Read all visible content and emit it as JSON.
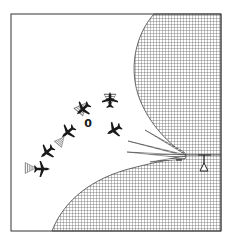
{
  "diagram": {
    "type": "illustration",
    "colors": {
      "background": "#ffffff",
      "ink": "#1a1a1a",
      "hatch": "#555555",
      "frame": "#333333"
    },
    "frame": {
      "x": 11,
      "y": 14,
      "w": 210,
      "h": 217
    },
    "radar": {
      "label": "",
      "icon": "radar-antenna-icon",
      "x": 204,
      "y": 155
    },
    "beams": [
      {
        "tip": [
          145,
          130
        ]
      },
      {
        "tip": [
          128,
          141
        ]
      },
      {
        "tip": [
          127,
          152
        ]
      },
      {
        "tip": [
          150,
          162
        ]
      }
    ],
    "beam_origin": [
      186,
      155
    ],
    "aircraft": [
      {
        "x": 82,
        "y": 108,
        "rot": 40
      },
      {
        "x": 110,
        "y": 102,
        "rot": 0
      },
      {
        "x": 115,
        "y": 131,
        "rot": 60
      },
      {
        "x": 68,
        "y": 133,
        "rot": 40
      },
      {
        "x": 47,
        "y": 153,
        "rot": 40
      },
      {
        "x": 41,
        "y": 168,
        "rot": 90
      }
    ],
    "jammer_cones": [
      {
        "x": 91,
        "y": 95,
        "rot": 220
      },
      {
        "x": 110,
        "y": 114,
        "rot": 180
      },
      {
        "x": 60,
        "y": 144,
        "rot": 220
      },
      {
        "x": 25,
        "y": 168,
        "rot": 270
      }
    ],
    "marker": {
      "label": "0",
      "x": 88,
      "y": 123
    }
  }
}
